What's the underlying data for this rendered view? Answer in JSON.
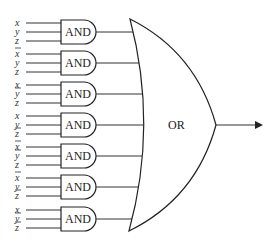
{
  "diagram": {
    "gate_type_and": "AND",
    "gate_type_or": "OR",
    "and_gates": [
      {
        "inputs": [
          {
            "var": "x",
            "bar": false
          },
          {
            "var": "y",
            "bar": false
          },
          {
            "var": "z",
            "bar": false
          }
        ]
      },
      {
        "inputs": [
          {
            "var": "x",
            "bar": true
          },
          {
            "var": "y",
            "bar": false
          },
          {
            "var": "z",
            "bar": false
          }
        ]
      },
      {
        "inputs": [
          {
            "var": "x",
            "bar": false
          },
          {
            "var": "y",
            "bar": true
          },
          {
            "var": "z",
            "bar": false
          }
        ]
      },
      {
        "inputs": [
          {
            "var": "x",
            "bar": false
          },
          {
            "var": "y",
            "bar": false
          },
          {
            "var": "z",
            "bar": true
          }
        ]
      },
      {
        "inputs": [
          {
            "var": "x",
            "bar": true
          },
          {
            "var": "y",
            "bar": true
          },
          {
            "var": "z",
            "bar": false
          }
        ]
      },
      {
        "inputs": [
          {
            "var": "x",
            "bar": true
          },
          {
            "var": "y",
            "bar": false
          },
          {
            "var": "z",
            "bar": true
          }
        ]
      },
      {
        "inputs": [
          {
            "var": "x",
            "bar": false
          },
          {
            "var": "y",
            "bar": true
          },
          {
            "var": "z",
            "bar": true
          }
        ]
      }
    ],
    "or_gate": {
      "label": "OR"
    },
    "output": {
      "arrow": "arrow-right-icon"
    },
    "colors": {
      "stroke": "#222222",
      "background": "#ffffff"
    }
  }
}
